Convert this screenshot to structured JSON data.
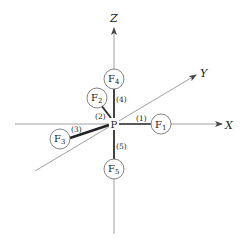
{
  "diagram": {
    "axes": {
      "x": {
        "label": "X"
      },
      "y": {
        "label": "Y"
      },
      "z": {
        "label": "Z"
      }
    },
    "center": {
      "label": "P"
    },
    "nodes": [
      {
        "id": "F1",
        "base": "F",
        "sub": "1"
      },
      {
        "id": "F2",
        "base": "F",
        "sub": "2"
      },
      {
        "id": "F3",
        "base": "F",
        "sub": "3"
      },
      {
        "id": "F4",
        "base": "F",
        "sub": "4"
      },
      {
        "id": "F5",
        "base": "F",
        "sub": "5"
      }
    ],
    "edges": [
      {
        "label": "(1)",
        "from": "P",
        "to": "F1"
      },
      {
        "label": "(2)",
        "from": "P",
        "to": "F2"
      },
      {
        "label": "(3)",
        "from": "P",
        "to": "F3"
      },
      {
        "label": "(4)",
        "from": "P",
        "to": "F4"
      },
      {
        "label": "(5)",
        "from": "P",
        "to": "F5"
      }
    ],
    "colors": {
      "axis": "#777777",
      "bond": "#333333",
      "text": "#222222"
    }
  }
}
